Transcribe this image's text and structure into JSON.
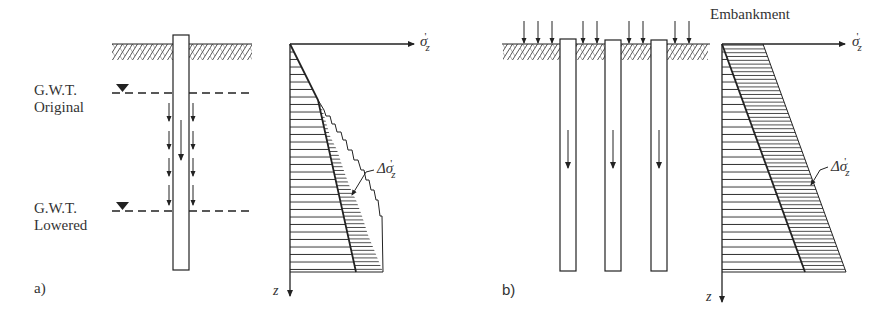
{
  "figure": {
    "panel_a": {
      "label": "a)",
      "gwt_original": {
        "line1": "G.W.T.",
        "line2": "Original"
      },
      "gwt_lowered": {
        "line1": "G.W.T.",
        "line2": "Lowered"
      },
      "chart": {
        "x_axis": "σ",
        "x_axis_sub": "z",
        "x_axis_prime": "'",
        "z_axis": "z",
        "delta_label": "Δσ",
        "delta_sub": "z",
        "delta_prime": "'"
      }
    },
    "panel_b": {
      "label": "b)",
      "embankment": "Embankment",
      "chart": {
        "x_axis": "σ",
        "x_axis_sub": "z",
        "x_axis_prime": "'",
        "z_axis": "z",
        "delta_label": "Δσ",
        "delta_sub": "z",
        "delta_prime": "'"
      }
    }
  },
  "colors": {
    "line": "#222222",
    "hatch": "#444444",
    "background": "#ffffff"
  }
}
